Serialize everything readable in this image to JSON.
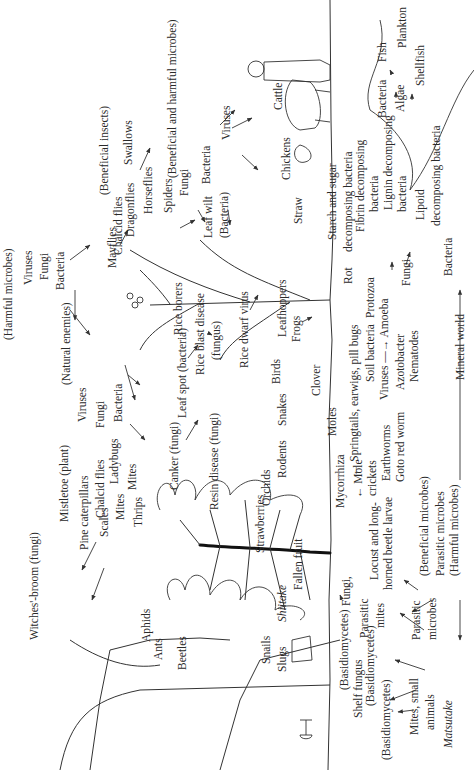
{
  "diagram": {
    "title": "",
    "orientation": "rotated 90° counter-clockwise (text reads bottom-to-top)",
    "groups": {
      "harmful_microbes": {
        "heading": "(Harmful microbes)",
        "items": [
          "Viruses",
          "Fungi",
          "Bacteria"
        ]
      },
      "natural_enemies": {
        "heading": "(Natural enemies)",
        "items": [
          "Viruses",
          "Fungi",
          "Bacteria"
        ]
      },
      "beneficial_insects": {
        "heading": "(Beneficial insects)",
        "items": [
          "Mayflies",
          "Chalcid flies",
          "Dragonflies",
          "Horseflies",
          "Swallows",
          "Spiders"
        ]
      },
      "beneficial_harmful": {
        "heading": "(Beneficial and harmful microbes)",
        "items": [
          "Fungi",
          "Bacteria",
          "Viruses"
        ]
      },
      "soil_microbes": {
        "heading": "",
        "items": [
          "(Beneficial microbes)",
          "Parasitic microbes",
          "(Harmful microbes)"
        ]
      }
    },
    "labels": [
      {
        "id": "witches-broom",
        "text": "Witches'-broom (fungi)",
        "x": 38,
        "y": 640
      },
      {
        "id": "harmful-microbes",
        "text": "(Harmful microbes)",
        "x": 12,
        "y": 340
      },
      {
        "id": "hm-viruses",
        "text": "Viruses",
        "x": 32,
        "y": 285
      },
      {
        "id": "hm-fungi",
        "text": "Fungi",
        "x": 48,
        "y": 280
      },
      {
        "id": "hm-bacteria",
        "text": "Bacteria",
        "x": 64,
        "y": 290
      },
      {
        "id": "beneficial-insects",
        "text": "(Beneficial insects)",
        "x": 108,
        "y": 195
      },
      {
        "id": "swallows",
        "text": "Swallows",
        "x": 132,
        "y": 165
      },
      {
        "id": "mayflies",
        "text": "Mayflies",
        "x": 116,
        "y": 268
      },
      {
        "id": "chalcid-flies-1",
        "text": "Chalcid flies",
        "x": 122,
        "y": 255
      },
      {
        "id": "dragonflies",
        "text": "Dragonflies",
        "x": 134,
        "y": 237
      },
      {
        "id": "horseflies",
        "text": "Horseflies",
        "x": 152,
        "y": 214
      },
      {
        "id": "spiders",
        "text": "Spiders",
        "x": 172,
        "y": 213
      },
      {
        "id": "ben-harm-microbes",
        "text": "(Beneficial and harmful microbes)",
        "x": 176,
        "y": 178
      },
      {
        "id": "bhm-fungi",
        "text": "Fungi",
        "x": 188,
        "y": 196
      },
      {
        "id": "bhm-bacteria",
        "text": "Bacteria",
        "x": 210,
        "y": 184
      },
      {
        "id": "leaf-wilt",
        "text": "Leaf wilt",
        "x": 212,
        "y": 238
      },
      {
        "id": "leaf-wilt-bacteria",
        "text": "(Bacteria)",
        "x": 228,
        "y": 238
      },
      {
        "id": "viruses-livestock",
        "text": "Viruses",
        "x": 230,
        "y": 140
      },
      {
        "id": "cattle",
        "text": "Cattle",
        "x": 282,
        "y": 110
      },
      {
        "id": "chickens",
        "text": "Chickens",
        "x": 290,
        "y": 180
      },
      {
        "id": "straw",
        "text": "Straw",
        "x": 302,
        "y": 224
      },
      {
        "id": "starch-sugar",
        "text": "Starch and sugar",
        "x": 336,
        "y": 240
      },
      {
        "id": "starch-sugar-2",
        "text": "decomposing bacteria",
        "x": 352,
        "y": 252
      },
      {
        "id": "fibrin",
        "text": "Fibrin decomposing",
        "x": 364,
        "y": 232
      },
      {
        "id": "fibrin-2",
        "text": "bacteria",
        "x": 378,
        "y": 212
      },
      {
        "id": "lignin",
        "text": "Lignin decomposing",
        "x": 392,
        "y": 210
      },
      {
        "id": "lignin-2",
        "text": "bacteria",
        "x": 406,
        "y": 212
      },
      {
        "id": "lipoid",
        "text": "Lipoid",
        "x": 424,
        "y": 220
      },
      {
        "id": "lipoid-2",
        "text": "decomposing bacteria",
        "x": 440,
        "y": 226
      },
      {
        "id": "aq-bacteria",
        "text": "Bacteria",
        "x": 386,
        "y": 118
      },
      {
        "id": "algae",
        "text": "Algae",
        "x": 404,
        "y": 112
      },
      {
        "id": "fish",
        "text": "Fish",
        "x": 386,
        "y": 62
      },
      {
        "id": "plankton",
        "text": "Plankton",
        "x": 406,
        "y": 48
      },
      {
        "id": "shellfish",
        "text": "Shellfish",
        "x": 424,
        "y": 86
      },
      {
        "id": "natural-enemies",
        "text": "(Natural enemies)",
        "x": 70,
        "y": 385
      },
      {
        "id": "ne-viruses",
        "text": "Viruses",
        "x": 86,
        "y": 422
      },
      {
        "id": "ne-fungi",
        "text": "Fungi",
        "x": 104,
        "y": 428
      },
      {
        "id": "ne-bacteria",
        "text": "Bacteria",
        "x": 122,
        "y": 422
      },
      {
        "id": "mistletoe",
        "text": "Mistletoe (plant)",
        "x": 68,
        "y": 522
      },
      {
        "id": "pine-caterpillars",
        "text": "Pine caterpillars",
        "x": 88,
        "y": 550
      },
      {
        "id": "chalcid-flies-2",
        "text": "Chalcid flies",
        "x": 104,
        "y": 518
      },
      {
        "id": "ladybugs",
        "text": "Ladybugs",
        "x": 118,
        "y": 484
      },
      {
        "id": "scales",
        "text": "Scales",
        "x": 108,
        "y": 537
      },
      {
        "id": "mites-1",
        "text": "Mites",
        "x": 124,
        "y": 520
      },
      {
        "id": "mites-2",
        "text": "Mites",
        "x": 136,
        "y": 490
      },
      {
        "id": "thrips",
        "text": "Thrips",
        "x": 142,
        "y": 527
      },
      {
        "id": "canker",
        "text": "Canker (fungi)",
        "x": 178,
        "y": 490
      },
      {
        "id": "leaf-spot",
        "text": "Leaf spot (bacteria)",
        "x": 186,
        "y": 418
      },
      {
        "id": "resin-disease",
        "text": "Resin disease (fungi)",
        "x": 218,
        "y": 510
      },
      {
        "id": "rice-borers",
        "text": "Rice borers",
        "x": 182,
        "y": 335
      },
      {
        "id": "rice-blast",
        "text": "Rice blast disease",
        "x": 204,
        "y": 375
      },
      {
        "id": "rice-blast-2",
        "text": "(fungus)",
        "x": 220,
        "y": 360
      },
      {
        "id": "rice-dwarf",
        "text": "Rice dwarf virus",
        "x": 248,
        "y": 368
      },
      {
        "id": "birds",
        "text": "Birds",
        "x": 280,
        "y": 384
      },
      {
        "id": "leafhoppers",
        "text": "Leafhoppers",
        "x": 286,
        "y": 337
      },
      {
        "id": "frogs",
        "text": "Frogs",
        "x": 300,
        "y": 342
      },
      {
        "id": "snakes",
        "text": "Snakes",
        "x": 286,
        "y": 426
      },
      {
        "id": "rodents",
        "text": "Rodents",
        "x": 286,
        "y": 478
      },
      {
        "id": "orchids",
        "text": "Orchids",
        "x": 270,
        "y": 506
      },
      {
        "id": "strawberries",
        "text": "Strawberries",
        "x": 264,
        "y": 553
      },
      {
        "id": "clover",
        "text": "Clover",
        "x": 320,
        "y": 396
      },
      {
        "id": "moles",
        "text": "Moles",
        "x": 336,
        "y": 436
      },
      {
        "id": "springtails",
        "text": "← Springtails, earwigs, pill bugs",
        "x": 358,
        "y": 476
      },
      {
        "id": "mole-crickets",
        "text": "← Mole",
        "x": 362,
        "y": 498
      },
      {
        "id": "mole-crickets-2",
        "text": "crickets",
        "x": 376,
        "y": 496
      },
      {
        "id": "mycorrhiza",
        "text": "Mycorrhiza",
        "x": 344,
        "y": 508
      },
      {
        "id": "soil-bacteria",
        "text": "Soil bacteria",
        "x": 374,
        "y": 382
      },
      {
        "id": "viruses-soil",
        "text": "Viruses —→ Amoeba",
        "x": 388,
        "y": 400
      },
      {
        "id": "protozoa",
        "text": "Protozoa",
        "x": 374,
        "y": 318
      },
      {
        "id": "azotobacter",
        "text": "Azotobacter",
        "x": 404,
        "y": 390
      },
      {
        "id": "nematodes",
        "text": "Nematodes",
        "x": 418,
        "y": 382
      },
      {
        "id": "earthworms",
        "text": "Earthworms",
        "x": 390,
        "y": 481
      },
      {
        "id": "goto-red-worm",
        "text": "Goto red worm",
        "x": 404,
        "y": 482
      },
      {
        "id": "fungi-soil",
        "text": "Fungi",
        "x": 410,
        "y": 286
      },
      {
        "id": "rot",
        "text": "Rot",
        "x": 352,
        "y": 284
      },
      {
        "id": "bacteria-soil",
        "text": "Bacteria",
        "x": 452,
        "y": 276
      },
      {
        "id": "mineral-world",
        "text": "Mineral world",
        "x": 464,
        "y": 380
      },
      {
        "id": "beneficial-microbes-soil",
        "text": "(Beneficial microbes)",
        "x": 428,
        "y": 576
      },
      {
        "id": "parasitic-microbes-soil",
        "text": "Parasitic microbes",
        "x": 444,
        "y": 576
      },
      {
        "id": "harmful-microbes-soil",
        "text": "(Harmful microbes)",
        "x": 458,
        "y": 576
      },
      {
        "id": "locust",
        "text": "Locust and long-",
        "x": 378,
        "y": 580
      },
      {
        "id": "locust-2",
        "text": "horned beetle larvae",
        "x": 392,
        "y": 590
      },
      {
        "id": "aphids",
        "text": "Aphids",
        "x": 150,
        "y": 642
      },
      {
        "id": "ants",
        "text": "Ants",
        "x": 162,
        "y": 660
      },
      {
        "id": "beetles",
        "text": "Beetles",
        "x": 186,
        "y": 670
      },
      {
        "id": "snails",
        "text": "Snails",
        "x": 270,
        "y": 664
      },
      {
        "id": "slugs",
        "text": "Slugs",
        "x": 286,
        "y": 672
      },
      {
        "id": "shiitake",
        "text": "Shiitake",
        "x": 286,
        "y": 622,
        "italic": true
      },
      {
        "id": "fallen-fruit",
        "text": "Fallen fruit",
        "x": 302,
        "y": 590
      },
      {
        "id": "fungi-fruit",
        "text": "Fungi,",
        "x": 350,
        "y": 606
      },
      {
        "id": "parasitic-mites",
        "text": "Parasitic",
        "x": 368,
        "y": 638
      },
      {
        "id": "parasitic-mites-2",
        "text": "mites",
        "x": 384,
        "y": 628
      },
      {
        "id": "basidio-1",
        "text": "(Basidiomycetes)",
        "x": 348,
        "y": 690
      },
      {
        "id": "shelf-fungus",
        "text": "Shelf fungus",
        "x": 362,
        "y": 718
      },
      {
        "id": "basidio-2",
        "text": "(Basidiomycetes)",
        "x": 374,
        "y": 706
      },
      {
        "id": "basidio-3",
        "text": "(Basidiomycetes)",
        "x": 390,
        "y": 760
      },
      {
        "id": "parasitic-microbes-2",
        "text": "Parasitic",
        "x": 420,
        "y": 640
      },
      {
        "id": "parasitic-microbes-2b",
        "text": "microbes",
        "x": 436,
        "y": 640
      },
      {
        "id": "mites-small",
        "text": "Mites, small",
        "x": 418,
        "y": 735
      },
      {
        "id": "mites-small-2",
        "text": "animals",
        "x": 434,
        "y": 730
      },
      {
        "id": "matsutake",
        "text": "Matsutake",
        "x": 452,
        "y": 748,
        "italic": true
      }
    ]
  }
}
